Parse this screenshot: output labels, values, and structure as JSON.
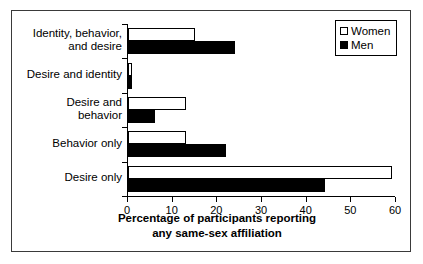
{
  "chart_data": {
    "type": "bar",
    "orientation": "horizontal",
    "title": "",
    "xlabel": "Percentage of participants reporting any same-sex affiliation",
    "xlabel_line1": "Percentage of participants reporting",
    "xlabel_line2": "any same-sex affiliation",
    "ylabel": "",
    "xlim": [
      0,
      60
    ],
    "xticks": [
      0,
      10,
      20,
      30,
      40,
      50,
      60
    ],
    "grid": false,
    "legend_position": "top-right",
    "categories": [
      "Identity, behavior, and desire",
      "Desire and identity",
      "Desire and behavior",
      "Behavior only",
      "Desire only"
    ],
    "category_lines": [
      [
        "Identity, behavior,",
        "and desire"
      ],
      [
        "Desire and identity"
      ],
      [
        "Desire and",
        "behavior"
      ],
      [
        "Behavior only"
      ],
      [
        "Desire only"
      ]
    ],
    "series": [
      {
        "name": "Women",
        "color": "#ffffff",
        "edge_color": "#000000",
        "values": [
          15,
          1,
          13,
          13,
          59
        ]
      },
      {
        "name": "Men",
        "color": "#000000",
        "edge_color": "#000000",
        "values": [
          24,
          1,
          6,
          22,
          44
        ]
      }
    ]
  },
  "legend": {
    "items": [
      {
        "label": "Women"
      },
      {
        "label": "Men"
      }
    ]
  }
}
